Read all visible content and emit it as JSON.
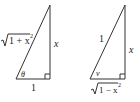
{
  "diagram": {
    "triangles": [
      {
        "id": "left",
        "hypotenuse_label": "√1 + x²",
        "hypotenuse_radicand": "1 + x",
        "hypotenuse_exponent": "2",
        "opposite_label": "x",
        "adjacent_label": "1",
        "angle_label": "θ",
        "right_angle": true
      },
      {
        "id": "right",
        "hypotenuse_label": "1",
        "opposite_label": "x",
        "adjacent_label": "√1 − x²",
        "adjacent_radicand": "1 − x",
        "adjacent_exponent": "2",
        "angle_label": "v",
        "right_angle": true
      }
    ]
  }
}
